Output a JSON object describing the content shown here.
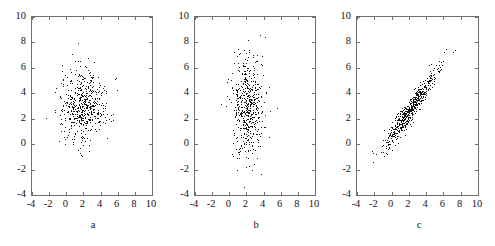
{
  "figure": {
    "background": "#ffffff",
    "axis_color": "#6e6e72",
    "point_color": "#141414"
  },
  "chart_data": [
    {
      "type": "scatter",
      "title": "",
      "xlabel": "a",
      "ylabel": "",
      "xlim": [
        -4,
        10
      ],
      "ylim": [
        -4,
        10
      ],
      "xticks": [
        -4,
        -2,
        0,
        2,
        4,
        6,
        8,
        10
      ],
      "yticks": [
        -4,
        -2,
        0,
        2,
        4,
        6,
        8,
        10
      ],
      "xticklabels": [
        "-4",
        "-2",
        "0",
        "2",
        "4",
        "6",
        "8",
        "10"
      ],
      "yticklabels": [
        "-4",
        "-2",
        "0",
        "2",
        "4",
        "6",
        "8",
        "10"
      ],
      "grid": false,
      "legend": "none",
      "n_points": 1000,
      "marker": "dot",
      "distribution": {
        "kind": "bivariate-normal",
        "mean_x": 2.0,
        "mean_y": 3.0,
        "sd_x": 1.4,
        "sd_y": 1.4,
        "correlation": 0.0
      },
      "annotation": "isotropic circular cloud centered near (2, 3)"
    },
    {
      "type": "scatter",
      "title": "",
      "xlabel": "b",
      "ylabel": "",
      "xlim": [
        -4,
        10
      ],
      "ylim": [
        -4,
        10
      ],
      "xticks": [
        -4,
        -2,
        0,
        2,
        4,
        6,
        8,
        10
      ],
      "yticks": [
        -4,
        -2,
        0,
        2,
        4,
        6,
        8,
        10
      ],
      "xticklabels": [
        "-4",
        "-2",
        "0",
        "2",
        "4",
        "6",
        "8",
        "10"
      ],
      "yticklabels": [
        "-4",
        "-2",
        "0",
        "2",
        "4",
        "6",
        "8",
        "10"
      ],
      "grid": false,
      "legend": "none",
      "n_points": 1000,
      "marker": "dot",
      "distribution": {
        "kind": "bivariate-normal",
        "mean_x": 2.1,
        "mean_y": 3.0,
        "sd_x": 0.9,
        "sd_y": 2.0,
        "correlation": 0.0
      },
      "annotation": "vertically elongated cloud centered near (2, 3)"
    },
    {
      "type": "scatter",
      "title": "",
      "xlabel": "c",
      "ylabel": "",
      "xlim": [
        -4,
        10
      ],
      "ylim": [
        -4,
        10
      ],
      "xticks": [
        -4,
        -2,
        0,
        2,
        4,
        6,
        8,
        10
      ],
      "yticks": [
        -4,
        -2,
        0,
        2,
        4,
        6,
        8,
        10
      ],
      "xticklabels": [
        "-4",
        "-2",
        "0",
        "2",
        "4",
        "6",
        "8",
        "10"
      ],
      "yticklabels": [
        "-4",
        "-2",
        "0",
        "2",
        "4",
        "6",
        "8",
        "10"
      ],
      "grid": false,
      "legend": "none",
      "n_points": 1000,
      "marker": "dot",
      "distribution": {
        "kind": "bivariate-normal",
        "mean_x": 2.1,
        "mean_y": 2.7,
        "sd_x": 1.5,
        "sd_y": 1.5,
        "correlation": 0.95
      },
      "annotation": "strongly positively correlated elongated diagonal cloud"
    }
  ]
}
